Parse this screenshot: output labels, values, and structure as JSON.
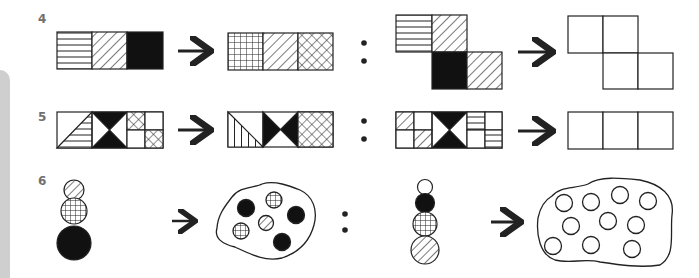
{
  "puzzle_rows": [
    {
      "number": "4",
      "description": "Analogy: three-cell strip (horizontal lines, diagonal hatch, solid black) transforms to (grid, diagonal hatch, crosshatch); apply same to L-shaped arrangement",
      "left_source": [
        "horizontal-lines",
        "diagonal-hatch",
        "solid-black"
      ],
      "left_result": [
        "grid",
        "diagonal-hatch",
        "crosshatch"
      ],
      "right_source_layout": "staircase-2x2",
      "right_source": [
        "horizontal-lines",
        "diagonal-hatch",
        "solid-black",
        "diagonal-hatch"
      ],
      "right_answer": [
        "blank",
        "blank",
        "blank",
        "blank"
      ]
    },
    {
      "number": "5",
      "description": "Analogy with triangular and quartered cells",
      "left_source": [
        "triangle-horizontal-lines",
        "bowtie-black",
        "quartered-crosshatch"
      ],
      "left_result": [
        "triangle-vertical-lines",
        "bowtie-black-sideways",
        "crosshatch"
      ],
      "right_source": [
        "quartered-diagonal",
        "bowtie-black",
        "halves-horizontal-lines"
      ],
      "right_answer": [
        "blank",
        "blank",
        "blank"
      ]
    },
    {
      "number": "6",
      "description": "Stack of circles transforms into a blob containing counted circles",
      "left_source": [
        "diagonal-hatch-small",
        "grid-medium",
        "solid-black-large"
      ],
      "left_result": {
        "solid-black": 3,
        "grid": 2,
        "diagonal-hatch": 1
      },
      "right_source": [
        "empty-small",
        "solid-black",
        "grid",
        "diagonal-hatch-large"
      ],
      "right_answer": {
        "empty-circles": 10
      }
    }
  ],
  "symbols": {
    "arrow": "→",
    "analogy_separator": ":"
  },
  "colors": {
    "ink": "#222222",
    "label": "#707070",
    "side_strip": "#cfcfcf"
  }
}
